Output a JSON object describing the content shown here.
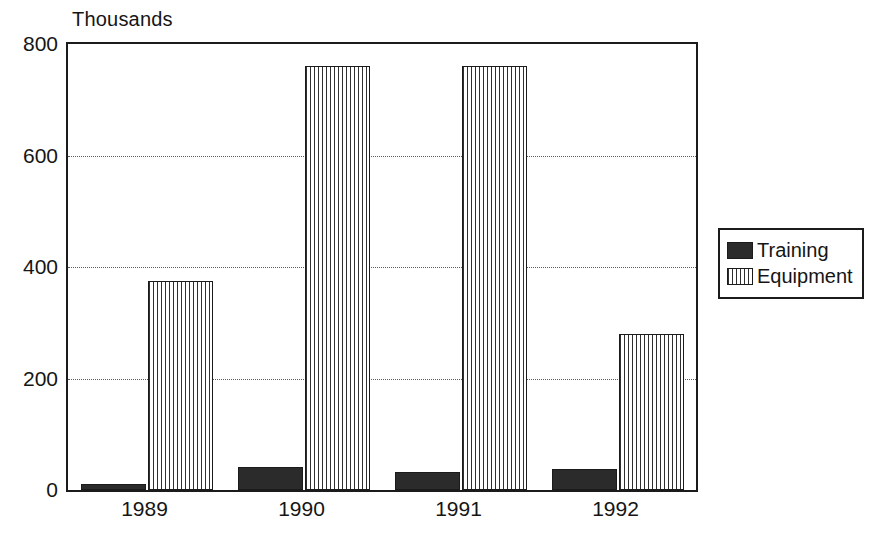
{
  "chart_data": {
    "type": "bar",
    "title": "",
    "unit_label": "Thousands",
    "xlabel": "",
    "ylabel": "Thousands",
    "categories": [
      "1989",
      "1990",
      "1991",
      "1992"
    ],
    "series": [
      {
        "name": "Training",
        "color": "#2b2b2b",
        "fill": "solid",
        "values": [
          10,
          41,
          32,
          37
        ]
      },
      {
        "name": "Equipment",
        "color": "#ffffff",
        "fill": "vertical-hatch",
        "values": [
          375,
          760,
          760,
          280
        ]
      }
    ],
    "ylim": [
      0,
      800
    ],
    "yticks": [
      0,
      200,
      400,
      600,
      800
    ],
    "ytick_labels": [
      "0",
      "200",
      "400",
      "600",
      "800"
    ],
    "grid": "horizontal-dotted",
    "legend_position": "right",
    "legend_entries": [
      "Training",
      "Equipment"
    ]
  },
  "legend": {
    "items": [
      {
        "label": "Training"
      },
      {
        "label": "Equipment"
      }
    ]
  }
}
